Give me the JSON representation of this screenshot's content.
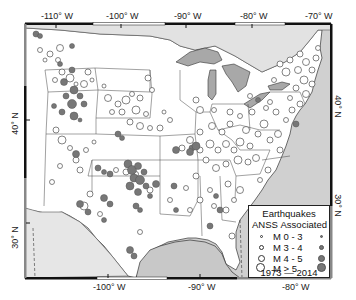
{
  "axes": {
    "top_lon_labels": [
      {
        "text": "-110° W",
        "x": 56
      },
      {
        "text": "-100° W",
        "x": 121
      },
      {
        "text": "-90° W",
        "x": 186
      },
      {
        "text": "-80° W",
        "x": 252
      },
      {
        "text": "-70° W",
        "x": 328
      }
    ],
    "bottom_lon_labels": [
      {
        "text": "-100° W",
        "x": 108
      },
      {
        "text": "-90° W",
        "x": 200
      },
      {
        "text": "-80° W",
        "x": 293
      }
    ],
    "left_lat_labels": [
      {
        "text": "40° N",
        "y": 123
      },
      {
        "text": "30° N",
        "y": 237
      }
    ],
    "right_lat_labels": [
      {
        "text": "40° N",
        "y": 106
      },
      {
        "text": "30° N",
        "y": 205
      }
    ]
  },
  "legend": {
    "title": "Earthquakes",
    "col_anss": "ANSS",
    "col_associated": "Associated",
    "rows": [
      {
        "label": "M 0 - 3",
        "size": 2
      },
      {
        "label": "M 3 - 4",
        "size": 4
      },
      {
        "label": "M 4 - 5",
        "size": 6
      },
      {
        "label": "M > 5",
        "size": 8
      }
    ],
    "years": "1973 — 2014"
  },
  "colors": {
    "land": "#ffffff",
    "water": "#c8c8c8",
    "lake": "#a8a8a8",
    "associated": "#777777",
    "frame": "#111111"
  }
}
